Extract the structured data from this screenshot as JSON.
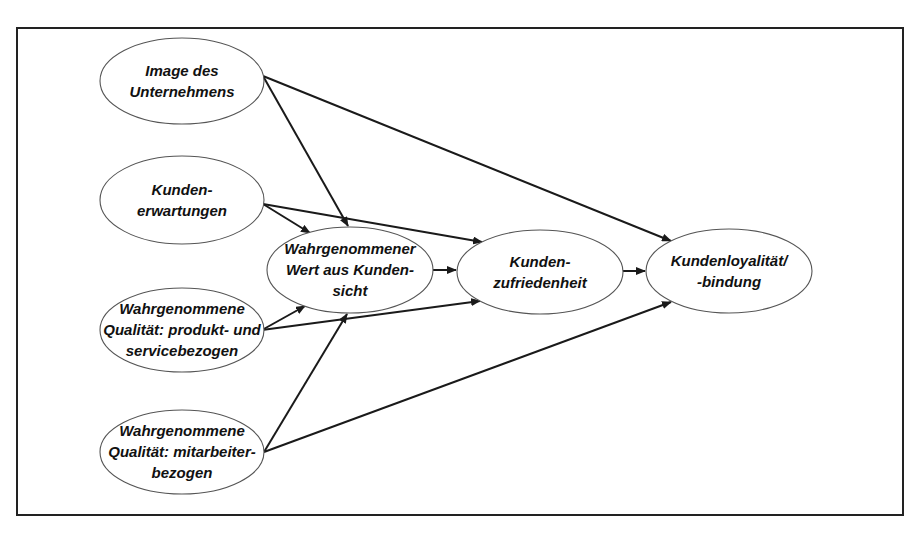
{
  "diagram": {
    "type": "flow",
    "frame": {
      "x": 17,
      "y": 28,
      "width": 886,
      "height": 487
    },
    "colors": {
      "stroke": "#1a1a1a",
      "node_border": "#555555",
      "background": "#ffffff",
      "text": "#111111"
    },
    "nodes": [
      {
        "id": "image",
        "lines": [
          "Image des",
          "Unternehmens"
        ],
        "cx": 182,
        "cy": 81,
        "rx": 82,
        "ry": 43
      },
      {
        "id": "erwartungen",
        "lines": [
          "Kunden-",
          "erwartungen"
        ],
        "cx": 182,
        "cy": 200,
        "rx": 82,
        "ry": 44
      },
      {
        "id": "qualitaet_produkt",
        "lines": [
          "Wahrgenommene",
          "Qualität: produkt- und",
          "servicebezogen"
        ],
        "cx": 182,
        "cy": 330,
        "rx": 82,
        "ry": 42
      },
      {
        "id": "qualitaet_mitarbeiter",
        "lines": [
          "Wahrgenommene",
          "Qualität: mitarbeiter-",
          "bezogen"
        ],
        "cx": 182,
        "cy": 452,
        "rx": 82,
        "ry": 42
      },
      {
        "id": "wert",
        "lines": [
          "Wahrgenommener",
          "Wert aus Kunden-",
          "sicht"
        ],
        "cx": 350,
        "cy": 270,
        "rx": 83,
        "ry": 43
      },
      {
        "id": "zufriedenheit",
        "lines": [
          "Kunden-",
          "zufriedenheit"
        ],
        "cx": 540,
        "cy": 272,
        "rx": 83,
        "ry": 42
      },
      {
        "id": "loyalitaet",
        "lines": [
          "Kundenloyalität/",
          "-bindung"
        ],
        "cx": 729,
        "cy": 271,
        "rx": 83,
        "ry": 42
      }
    ],
    "edges": [
      {
        "from": "image",
        "to": "wert",
        "x1": 263,
        "y1": 76,
        "x2": 348,
        "y2": 226
      },
      {
        "from": "image",
        "to": "loyalitaet",
        "x1": 263,
        "y1": 76,
        "x2": 671,
        "y2": 241
      },
      {
        "from": "erwartungen",
        "to": "wert",
        "x1": 263,
        "y1": 204,
        "x2": 310,
        "y2": 233
      },
      {
        "from": "erwartungen",
        "to": "zufriedenheit",
        "x1": 263,
        "y1": 204,
        "x2": 482,
        "y2": 242
      },
      {
        "from": "qualitaet_produkt",
        "to": "wert",
        "x1": 262,
        "y1": 330,
        "x2": 305,
        "y2": 306
      },
      {
        "from": "qualitaet_produkt",
        "to": "zufriedenheit",
        "x1": 262,
        "y1": 330,
        "x2": 480,
        "y2": 301
      },
      {
        "from": "qualitaet_mitarbeiter",
        "to": "wert",
        "x1": 264,
        "y1": 452,
        "x2": 347,
        "y2": 314
      },
      {
        "from": "qualitaet_mitarbeiter",
        "to": "loyalitaet",
        "x1": 264,
        "y1": 452,
        "x2": 671,
        "y2": 302
      },
      {
        "from": "wert",
        "to": "zufriedenheit",
        "x1": 433,
        "y1": 270,
        "x2": 456,
        "y2": 270
      },
      {
        "from": "zufriedenheit",
        "to": "loyalitaet",
        "x1": 623,
        "y1": 271,
        "x2": 645,
        "y2": 271
      }
    ]
  }
}
